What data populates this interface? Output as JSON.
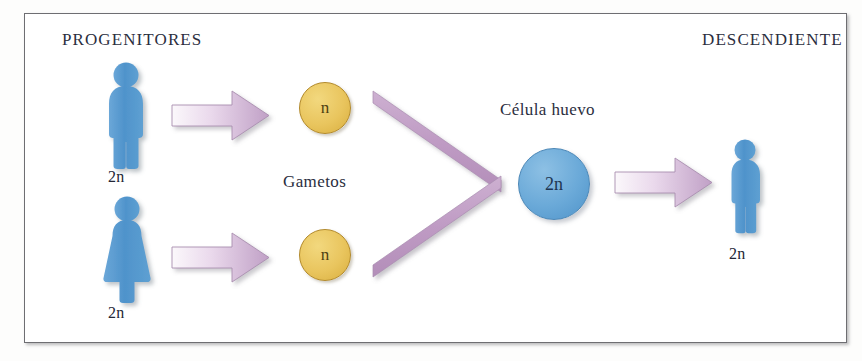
{
  "diagram": {
    "title_left": "PROGENITORES",
    "title_right": "DESCENDIENTE",
    "label_gametes": "Gametos",
    "label_zygote": "Célula huevo",
    "ploidy_father": "2n",
    "ploidy_mother": "2n",
    "ploidy_offspring": "2n",
    "gamete_male": "n",
    "gamete_female": "n",
    "zygote_value": "2n",
    "colors": {
      "figure_blue": "#5a9bd2",
      "gamete_yellow": "#e9c55e",
      "zygote_blue": "#6aa9d8",
      "arrow_mauve": "#c3a4c7",
      "arrow_light": "#f7f2f8",
      "chevron_mauve": "#bf9bc4",
      "text_navy": "#2b2e3e",
      "frame_border": "#6e6e72",
      "page_background": "#ffffff"
    },
    "icons": {
      "father": "male-figure-icon",
      "mother": "female-figure-icon",
      "offspring": "child-figure-icon",
      "arrow": "right-arrow-icon",
      "chevron": "converging-chevron-icon"
    }
  }
}
